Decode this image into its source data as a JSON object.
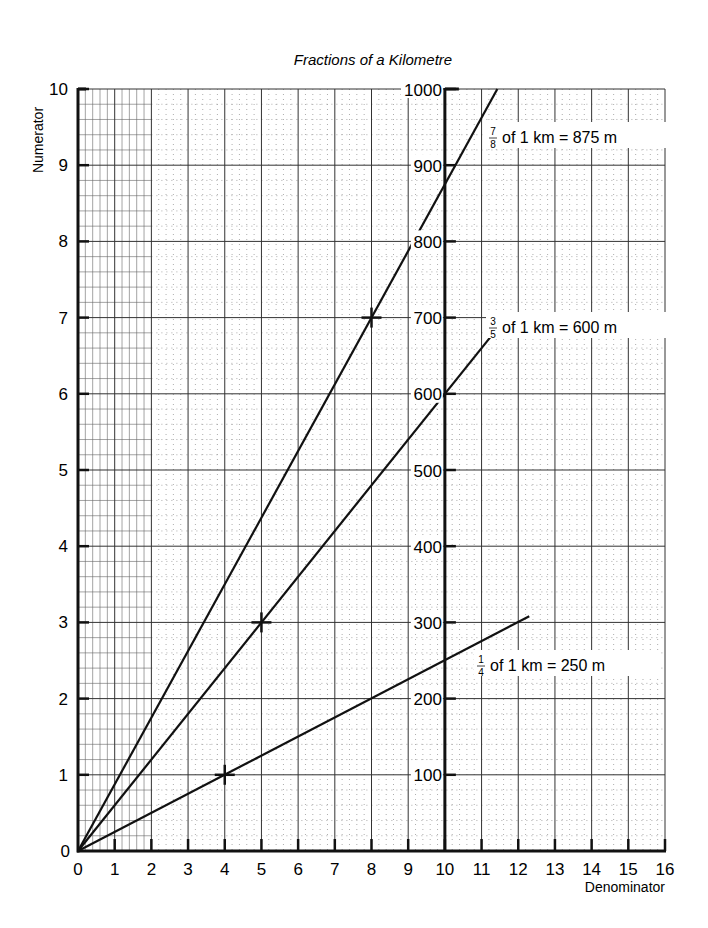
{
  "chart_data": {
    "type": "line",
    "title": "Fractions of a Kilometre",
    "xlabel": "Denominator",
    "ylabel": "Numerator",
    "xlim": [
      0,
      16
    ],
    "ylim": [
      0,
      10
    ],
    "x_ticks": [
      "0",
      "1",
      "2",
      "3",
      "4",
      "5",
      "6",
      "7",
      "8",
      "9",
      "10",
      "11",
      "12",
      "13",
      "14",
      "15",
      "16"
    ],
    "y_ticks": [
      "0",
      "1",
      "2",
      "3",
      "4",
      "5",
      "6",
      "7",
      "8",
      "9",
      "10"
    ],
    "secondary_axis": {
      "position_x": 10,
      "label_unit": "m",
      "ticks": [
        "100",
        "200",
        "300",
        "400",
        "500",
        "600",
        "700",
        "800",
        "900",
        "1000"
      ]
    },
    "grid": true,
    "series": [
      {
        "name": "7/8 of 1 km = 875 m",
        "slope": 0.875,
        "x": [
          0,
          11.43
        ],
        "y": [
          0,
          10
        ],
        "marked_point": {
          "x": 8,
          "y": 7
        },
        "label": {
          "num": "7",
          "den": "8",
          "text": "of 1 km  =  875 m"
        }
      },
      {
        "name": "3/5 of 1 km = 600 m",
        "slope": 0.6,
        "x": [
          0,
          11.7
        ],
        "y": [
          0,
          7.02
        ],
        "marked_point": {
          "x": 5,
          "y": 3
        },
        "label": {
          "num": "3",
          "den": "5",
          "text": "of 1 km = 600 m"
        }
      },
      {
        "name": "1/4 of 1 km = 250 m",
        "slope": 0.25,
        "x": [
          0,
          12.3
        ],
        "y": [
          0,
          3.08
        ],
        "marked_point": {
          "x": 4,
          "y": 1
        },
        "label": {
          "num": "1",
          "den": "4",
          "text": "of 1 km  =  250 m"
        }
      }
    ]
  }
}
